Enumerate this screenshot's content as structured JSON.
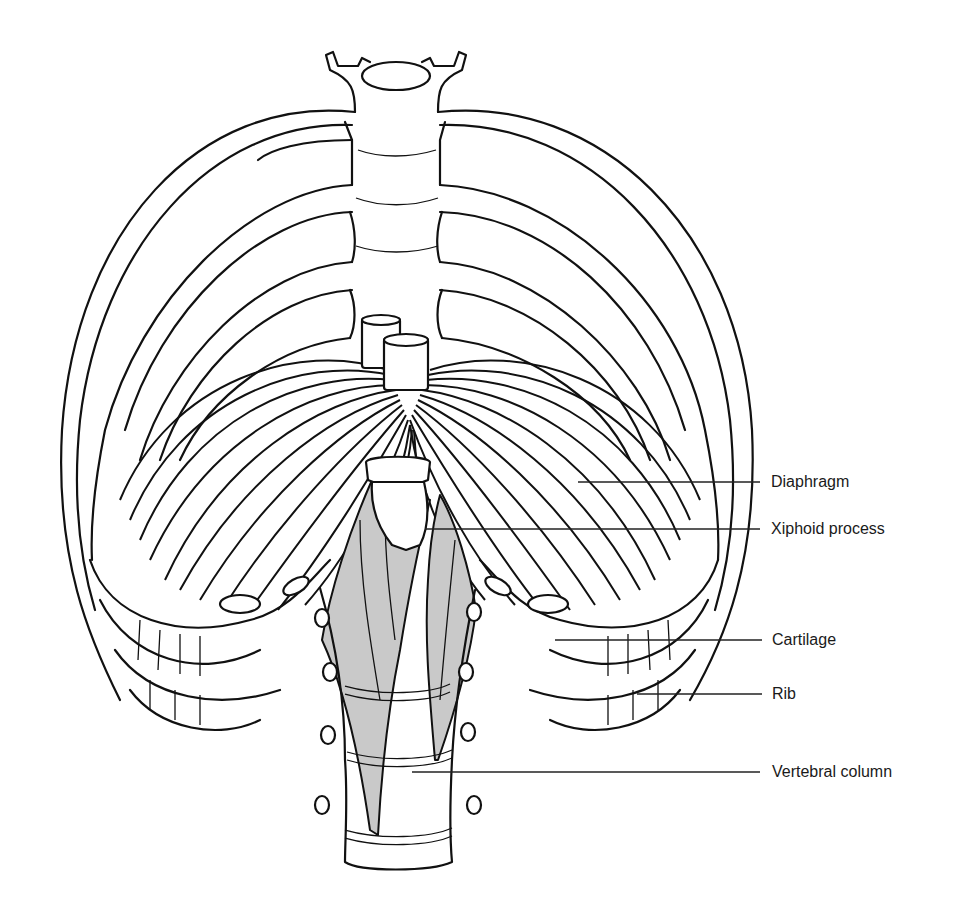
{
  "figure": {
    "labels": [
      {
        "id": "diaphragm",
        "text": "Diaphragm"
      },
      {
        "id": "xiphoid",
        "text": "Xiphoid process"
      },
      {
        "id": "cartilage",
        "text": "Cartilage"
      },
      {
        "id": "rib",
        "text": "Rib"
      },
      {
        "id": "vertebral",
        "text": "Vertebral column"
      }
    ]
  },
  "colors": {
    "line": "#111111",
    "muscle_fill": "#c9c9c9",
    "background": "#ffffff"
  }
}
